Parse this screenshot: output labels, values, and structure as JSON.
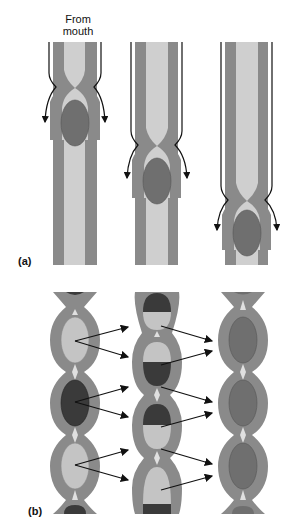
{
  "labels": {
    "from_mouth_line1": "From",
    "from_mouth_line2": "mouth",
    "panel_a": "(a)",
    "panel_b": "(b)"
  },
  "colors": {
    "wall": "#8a8a8a",
    "lumen": "#cfcfcf",
    "bolus": "#6f6f6f",
    "bolus_light": "#bdbdbd",
    "bolus_dark": "#3a3a3a",
    "arrow": "#111111",
    "background": "#ffffff"
  },
  "panel_a": {
    "description": "Peristalsis: bolus pushed down the tube by a moving constriction",
    "stages": [
      {
        "tube_center_x": 75,
        "constriction_y": 85,
        "bolus_center_y": 123
      },
      {
        "tube_center_x": 157,
        "constriction_y": 143,
        "bolus_center_y": 181
      },
      {
        "tube_center_x": 247,
        "constriction_y": 198,
        "bolus_center_y": 233
      }
    ]
  },
  "panel_b": {
    "description": "Segmentation: contents divided and mixed between adjacent segments",
    "columns": [
      {
        "center_x": 75,
        "segments": [
          "light",
          "dark",
          "light"
        ]
      },
      {
        "center_x": 157,
        "segments": [
          "dark/light",
          "light/dark",
          "dark/light",
          "light/dark"
        ]
      },
      {
        "center_x": 243,
        "segments": [
          "mixed",
          "mixed",
          "mixed"
        ]
      }
    ]
  }
}
